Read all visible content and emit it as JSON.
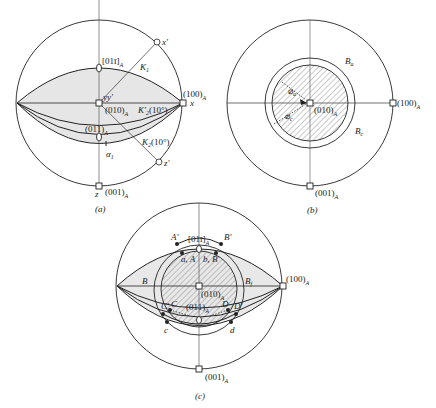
{
  "figure": {
    "panels": [
      {
        "id": "a",
        "caption": "(a)",
        "labels": {
          "pole_011bar": "[01ī]",
          "pole_011bar_sub": "A",
          "pole_100": "(100)",
          "pole_100_sub": "A",
          "axis_x": "x",
          "axis_xprime": "x'",
          "axis_yy": "yy'",
          "pole_010": "(010)",
          "pole_010_sub": "A",
          "K1": "K",
          "K1_sub": "1",
          "K2prime": "K'",
          "K2prime_sub": "2",
          "K2prime_angle": "(10°)",
          "pole_011": "(011)",
          "pole_011_sub": "A",
          "K2": "K",
          "K2_sub": "2",
          "K2_angle": "(10°)",
          "alpha": "α",
          "alpha_sub": "1",
          "axis_zprime": "z'",
          "axis_z": "z",
          "pole_001": "(001)",
          "pole_001_sub": "A"
        }
      },
      {
        "id": "b",
        "caption": "(b)",
        "labels": {
          "Ba": "B",
          "Ba_sub": "a",
          "Bc": "B",
          "Bc_sub": "c",
          "phi_a": "⌀",
          "phi_a_sub": "a",
          "phi_c": "⌀",
          "phi_c_sub": "c",
          "pole_010": "(010)",
          "pole_010_sub": "A",
          "pole_100": "(100)",
          "pole_100_sub": "A",
          "pole_001": "(001)",
          "pole_001_sub": "A"
        }
      },
      {
        "id": "c",
        "caption": "(c)",
        "labels": {
          "Aprime": "A'",
          "Bprime": "B'",
          "pole_011bar": "[01ī]",
          "pole_011bar_sub": "A",
          "aA": "a, A",
          "bB": "b, B",
          "B": "B",
          "Bf": "B",
          "Bf_sub": "f",
          "pole_100": "(100)",
          "pole_100_sub": "A",
          "pole_010": "(010)",
          "pole_010_sub": "A",
          "Cprime": "C'",
          "C": "C",
          "D": "D",
          "Dprime": "D'",
          "pole_011": "(011)",
          "pole_011_sub": "A",
          "c": "c",
          "d": "d",
          "pole_001": "(001)",
          "pole_001_sub": "A"
        }
      }
    ],
    "colors": {
      "line": "#222222",
      "shade": "#e4e4e4",
      "hatch": "#555555"
    }
  }
}
